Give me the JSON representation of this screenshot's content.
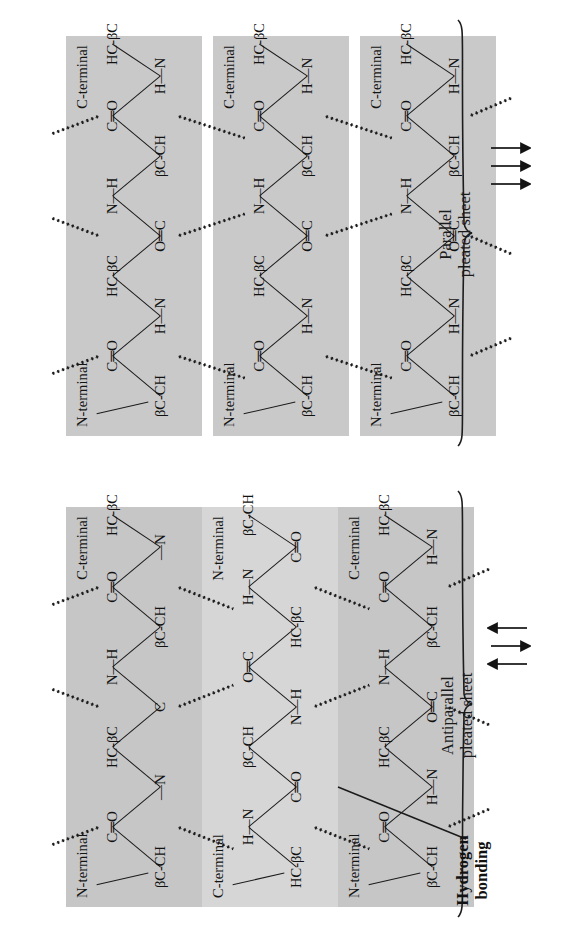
{
  "figure": {
    "orientation": "rotated-90-ccw",
    "background": "#ffffff",
    "strand_fill_parallel": "#c9c9c9",
    "strand_fill_antiparallel_dark": "#c6c6c6",
    "strand_fill_antiparallel_light": "#d6d6d6",
    "ink": "#1a1a1a"
  },
  "labels": {
    "n_terminal": "N-terminal",
    "c_terminal": "C-terminal",
    "hydrogen_bonding_line1": "Hydrogen",
    "hydrogen_bonding_line2": "bonding"
  },
  "residues": {
    "beta_c_ch": "βC-CH",
    "hc_beta_c": "HC-βC",
    "c_double_o": "C═O",
    "o_double_c": "O═C",
    "h_n": "H—N",
    "n_h": "N—H"
  },
  "panels": [
    {
      "id": "parallel",
      "caption_line1": "Parallel",
      "caption_line2": "pleated sheet",
      "arrow_directions": [
        "right",
        "right",
        "right"
      ],
      "strands": [
        {
          "index": 0,
          "left_terminal": "N-terminal",
          "right_terminal": "C-terminal",
          "sequence": [
            "βC-CH",
            "C═O",
            "H—N",
            "HC-βC",
            "O═C",
            "N—H",
            "βC-CH",
            "C═O",
            "H—N",
            "HC-βC"
          ]
        },
        {
          "index": 1,
          "left_terminal": "N-terminal",
          "right_terminal": "C-terminal",
          "sequence": [
            "βC-CH",
            "C═O",
            "H—N",
            "HC-βC",
            "O═C",
            "N—H",
            "βC-CH",
            "C═O",
            "H—N",
            "HC-βC"
          ]
        },
        {
          "index": 2,
          "left_terminal": "N-terminal",
          "right_terminal": "C-terminal",
          "sequence": [
            "βC-CH",
            "C═O",
            "H—N",
            "HC-βC",
            "O═C",
            "N—H",
            "βC-CH",
            "C═O",
            "H—N",
            "HC-βC"
          ]
        }
      ]
    },
    {
      "id": "antiparallel",
      "caption_line1": "Antiparallel",
      "caption_line2": "pleated sheet",
      "arrow_directions": [
        "right",
        "left",
        "right"
      ],
      "strands": [
        {
          "index": 0,
          "left_terminal": "N-terminal",
          "right_terminal": "C-terminal",
          "sequence": [
            "βC-CH",
            "C═O",
            "—N",
            "HC-βC",
            "C",
            "N—H",
            "βC-CH",
            "C═O",
            "—N",
            "HC-βC"
          ]
        },
        {
          "index": 1,
          "left_terminal": "C-terminal",
          "right_terminal": "N-terminal",
          "sequence": [
            "HC-βC",
            "H—N",
            "C═O",
            "βC-CH",
            "N—H",
            "O═C",
            "HC-βC",
            "H—N",
            "C═O",
            "βC-CH"
          ]
        },
        {
          "index": 2,
          "left_terminal": "N-terminal",
          "right_terminal": "C-terminal",
          "sequence": [
            "βC-CH",
            "C═O",
            "H—N",
            "HC-βC",
            "O═C",
            "N—H",
            "βC-CH",
            "C═O",
            "H—N",
            "HC-βC"
          ]
        }
      ]
    }
  ]
}
